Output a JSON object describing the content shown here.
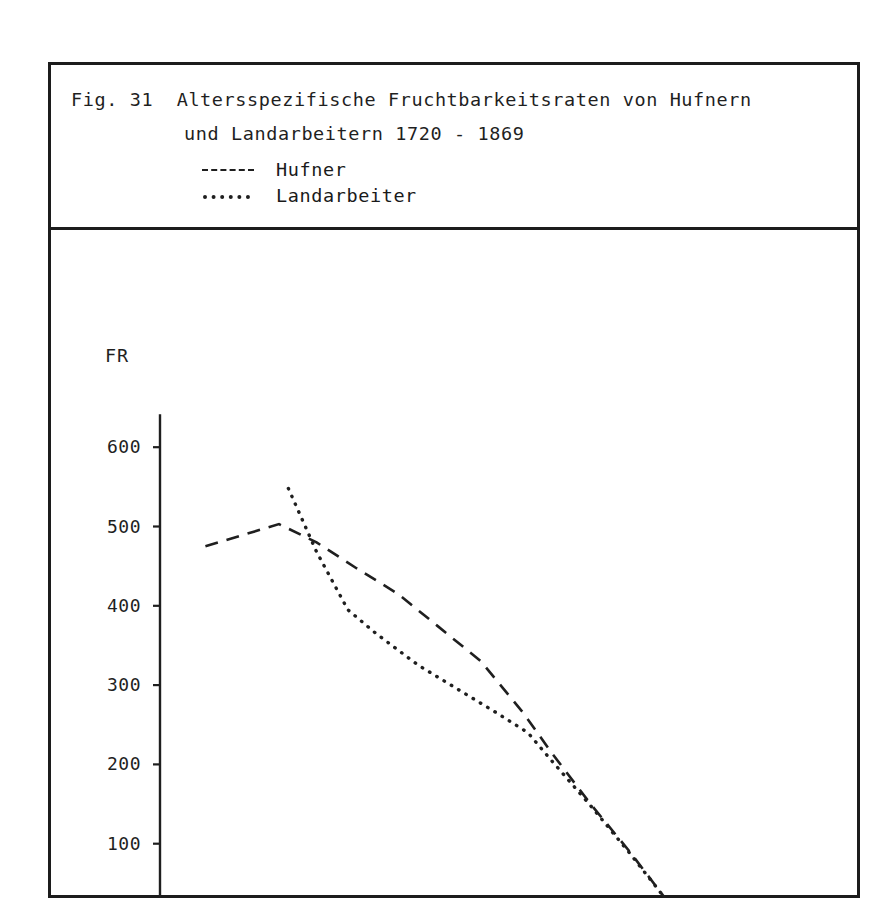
{
  "figure": {
    "caption_line_1": "Fig. 31  Altersspezifische Fruchtbarkeitsraten von Hufnern",
    "caption_line_2": "und Landarbeitern 1720 - 1869"
  },
  "legend": {
    "items": [
      {
        "marker": "dashed",
        "label": "Hufner"
      },
      {
        "marker": "dotted",
        "label": "Landarbeiter"
      }
    ]
  },
  "chart_data": {
    "type": "line",
    "title": "Fig. 31  Altersspezifische Fruchtbarkeitsraten von Hufnern und Landarbeitern 1720 - 1869",
    "xlabel": "Alter",
    "ylabel": "FR",
    "xlim": [
      15,
      50
    ],
    "ylim": [
      0,
      650
    ],
    "xticks": [
      15,
      20,
      25,
      30,
      35,
      40,
      45,
      50
    ],
    "xtick_labels": [
      "15",
      "20",
      "25",
      "30",
      "35",
      "40",
      "45",
      "50"
    ],
    "yticks": [
      100,
      200,
      300,
      400,
      500,
      600
    ],
    "ytick_labels": [
      "100",
      "200",
      "300",
      "400",
      "500",
      "600"
    ],
    "grid": false,
    "legend_position": "above-plot",
    "series": [
      {
        "name": "Hufner",
        "style": "dashed",
        "x": [
          17.9,
          22.6,
          25.0,
          27.5,
          30.2,
          32.7,
          35.5,
          38.2,
          40.0,
          42.5,
          45.0,
          47.5
        ],
        "y": [
          475,
          503,
          480,
          448,
          415,
          375,
          330,
          265,
          215,
          150,
          90,
          25
        ]
      },
      {
        "name": "Landarbeiter",
        "style": "dotted",
        "x": [
          23.2,
          25.0,
          27.0,
          28.8,
          31.5,
          34.0,
          36.5,
          38.5,
          40.0,
          42.5,
          45.0,
          47.5
        ],
        "y": [
          548,
          468,
          395,
          365,
          325,
          295,
          265,
          240,
          205,
          148,
          88,
          25
        ]
      }
    ]
  }
}
